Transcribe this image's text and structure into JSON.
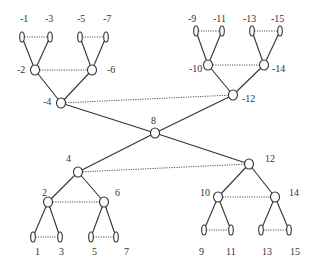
{
  "diagram": {
    "type": "mirrored-binary-tree-network",
    "nodes": [
      {
        "id": "-1",
        "kind": "leaf"
      },
      {
        "id": "-3",
        "kind": "leaf"
      },
      {
        "id": "-5",
        "kind": "leaf"
      },
      {
        "id": "-7",
        "kind": "leaf"
      },
      {
        "id": "-2",
        "kind": "node"
      },
      {
        "id": "-6",
        "kind": "node"
      },
      {
        "id": "-4",
        "kind": "node"
      },
      {
        "id": "-9",
        "kind": "leaf"
      },
      {
        "id": "-11",
        "kind": "leaf"
      },
      {
        "id": "-13",
        "kind": "leaf"
      },
      {
        "id": "-15",
        "kind": "leaf"
      },
      {
        "id": "-10",
        "kind": "node"
      },
      {
        "id": "-14",
        "kind": "node"
      },
      {
        "id": "-12",
        "kind": "node"
      },
      {
        "id": "8",
        "kind": "node"
      },
      {
        "id": "4",
        "kind": "node"
      },
      {
        "id": "2",
        "kind": "node"
      },
      {
        "id": "6",
        "kind": "node"
      },
      {
        "id": "1",
        "kind": "leaf"
      },
      {
        "id": "3",
        "kind": "leaf"
      },
      {
        "id": "5",
        "kind": "leaf"
      },
      {
        "id": "7",
        "kind": "leaf"
      },
      {
        "id": "12",
        "kind": "node"
      },
      {
        "id": "10",
        "kind": "node"
      },
      {
        "id": "14",
        "kind": "node"
      },
      {
        "id": "9",
        "kind": "leaf"
      },
      {
        "id": "11",
        "kind": "leaf"
      },
      {
        "id": "13",
        "kind": "leaf"
      },
      {
        "id": "15",
        "kind": "leaf"
      }
    ],
    "tree_edges": [
      [
        "-2",
        "-1"
      ],
      [
        "-2",
        "-3"
      ],
      [
        "-6",
        "-5"
      ],
      [
        "-6",
        "-7"
      ],
      [
        "-4",
        "-2"
      ],
      [
        "-4",
        "-6"
      ],
      [
        "-10",
        "-9"
      ],
      [
        "-10",
        "-11"
      ],
      [
        "-14",
        "-13"
      ],
      [
        "-14",
        "-15"
      ],
      [
        "-12",
        "-10"
      ],
      [
        "-12",
        "-14"
      ],
      [
        "8",
        "-4"
      ],
      [
        "8",
        "-12"
      ],
      [
        "8",
        "4"
      ],
      [
        "8",
        "12"
      ],
      [
        "4",
        "2"
      ],
      [
        "4",
        "6"
      ],
      [
        "2",
        "1"
      ],
      [
        "2",
        "3"
      ],
      [
        "6",
        "5"
      ],
      [
        "6",
        "7"
      ],
      [
        "12",
        "10"
      ],
      [
        "12",
        "14"
      ],
      [
        "10",
        "9"
      ],
      [
        "10",
        "11"
      ],
      [
        "14",
        "13"
      ],
      [
        "14",
        "15"
      ]
    ],
    "dotted_links": [
      [
        "-1",
        "-3"
      ],
      [
        "-5",
        "-7"
      ],
      [
        "-2",
        "-6"
      ],
      [
        "-4",
        "-12"
      ],
      [
        "-9",
        "-11"
      ],
      [
        "-13",
        "-15"
      ],
      [
        "-10",
        "-14"
      ],
      [
        "4",
        "12"
      ],
      [
        "2",
        "6"
      ],
      [
        "1",
        "3"
      ],
      [
        "5",
        "7"
      ],
      [
        "10",
        "14"
      ],
      [
        "9",
        "11"
      ],
      [
        "13",
        "15"
      ]
    ]
  }
}
